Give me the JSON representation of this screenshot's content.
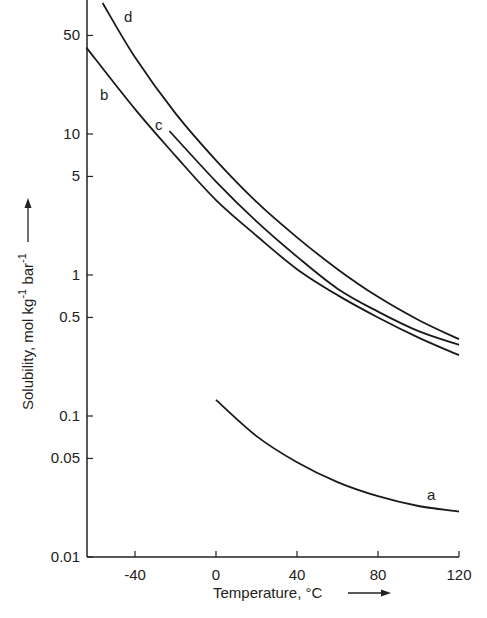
{
  "chart_data": {
    "type": "line",
    "title": "",
    "xlabel": "Temperature, °C",
    "ylabel": "Solubility, mol kg⁻¹ bar⁻¹",
    "yscale": "log",
    "xlim": [
      -64,
      120
    ],
    "ylim": [
      0.01,
      90
    ],
    "x_ticks": [
      -40,
      0,
      40,
      80,
      120
    ],
    "x_tick_labels": [
      "-40",
      "0",
      "40",
      "80",
      "120"
    ],
    "y_ticks": [
      50,
      10,
      5,
      1,
      0.5,
      0.1,
      0.05,
      0.01
    ],
    "y_tick_labels": [
      "50",
      "10",
      "5",
      "1",
      "0.5",
      "0.1",
      "0.05",
      "0.01"
    ],
    "grid": false,
    "legend": "inline curve labels",
    "series": [
      {
        "name": "a",
        "x": [
          0,
          20,
          40,
          60,
          80,
          100,
          120
        ],
        "values": [
          0.13,
          0.072,
          0.047,
          0.034,
          0.027,
          0.023,
          0.021
        ]
      },
      {
        "name": "b",
        "x": [
          -64,
          -40,
          -20,
          0,
          20,
          40,
          60,
          80,
          100,
          120
        ],
        "values": [
          41,
          15,
          7.0,
          3.4,
          1.9,
          1.1,
          0.72,
          0.5,
          0.36,
          0.27
        ]
      },
      {
        "name": "c",
        "x": [
          -23,
          0,
          20,
          40,
          60,
          80,
          100,
          120
        ],
        "values": [
          10.5,
          4.6,
          2.4,
          1.35,
          0.8,
          0.55,
          0.4,
          0.32
        ]
      },
      {
        "name": "d",
        "x": [
          -56,
          -40,
          -20,
          0,
          20,
          40,
          60,
          80,
          100,
          120
        ],
        "values": [
          85,
          35,
          14,
          6.5,
          3.3,
          1.85,
          1.1,
          0.7,
          0.48,
          0.35
        ]
      }
    ]
  },
  "labels": {
    "xlabel": "Temperature, °C",
    "ylabel_main": "Solubility, mol kg",
    "ylabel_sup1": "-1",
    "ylabel_mid": " bar",
    "ylabel_sup2": "-1",
    "curve_a": "a",
    "curve_b": "b",
    "curve_c": "c",
    "curve_d": "d"
  }
}
